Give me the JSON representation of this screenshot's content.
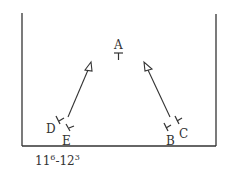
{
  "diagram": {
    "labels": {
      "A": "A",
      "B": "B",
      "C": "C",
      "D": "D",
      "E": "E"
    },
    "caption": {
      "base1": "11",
      "sup1": "6",
      "sep": "-12",
      "sup2": "3"
    },
    "colors": {
      "stroke": "#333333",
      "background": "#ffffff"
    }
  }
}
